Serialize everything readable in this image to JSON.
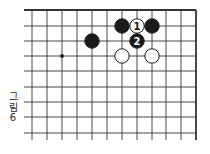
{
  "figure": {
    "caption_line1": "그",
    "caption_line2": "림",
    "caption_line3": "6",
    "caption_full": "그림 6"
  },
  "board": {
    "edges": [
      "top",
      "right"
    ],
    "columns": 12,
    "rows": 9,
    "grid_x": [
      32,
      47,
      62,
      77,
      92,
      107,
      122,
      137,
      152,
      166,
      181,
      196
    ],
    "grid_y": [
      10,
      26,
      41,
      56,
      71,
      87,
      102,
      117,
      133
    ],
    "line_color": "#333333",
    "star_points": [
      {
        "col": 2,
        "row": 3
      }
    ],
    "stones": [
      {
        "color": "black",
        "col": 6,
        "row": 1,
        "label": ""
      },
      {
        "color": "white",
        "col": 7,
        "row": 1,
        "label": "1"
      },
      {
        "color": "black",
        "col": 8,
        "row": 1,
        "label": ""
      },
      {
        "color": "black",
        "col": 4,
        "row": 2,
        "label": ""
      },
      {
        "color": "black",
        "col": 7,
        "row": 2,
        "label": "2"
      },
      {
        "color": "white",
        "col": 6,
        "row": 3,
        "label": ""
      },
      {
        "color": "white",
        "col": 8,
        "row": 3,
        "label": ""
      }
    ]
  }
}
